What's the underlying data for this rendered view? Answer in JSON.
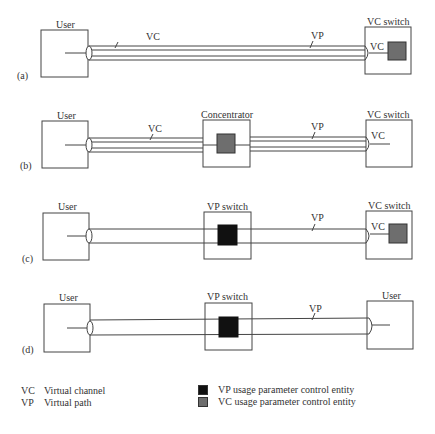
{
  "diagram": {
    "colors": {
      "vp_upc": "#111111",
      "vc_upc": "#6e6e6e",
      "line": "#444444"
    },
    "panels": [
      {
        "id": "a",
        "label": "(a)",
        "left_box": "User",
        "middle_box": null,
        "right_box": "VC switch",
        "pipe_label_1": "VC",
        "pipe_label_2": "VP",
        "inner_label": "VC"
      },
      {
        "id": "b",
        "label": "(b)",
        "left_box": "User",
        "middle_box": "Concentrator",
        "right_box": "VC switch",
        "pipe_label_1": "VC",
        "pipe_label_2": "VP",
        "inner_label": "VC"
      },
      {
        "id": "c",
        "label": "(c)",
        "left_box": "User",
        "middle_box": "VP switch",
        "right_box": "VC switch",
        "pipe_label_2": "VP",
        "inner_label": "VC"
      },
      {
        "id": "d",
        "label": "(d)",
        "left_box": "User",
        "middle_box": "VP switch",
        "right_box": "User",
        "pipe_label_2": "VP"
      }
    ],
    "legend": {
      "abbreviations": [
        {
          "abbr": "VC",
          "text": "Virtual channel"
        },
        {
          "abbr": "VP",
          "text": "Virtual path"
        }
      ],
      "entities": [
        {
          "text": "VP usage parameter control entity",
          "color": "#111111"
        },
        {
          "text": "VC usage parameter control entity",
          "color": "#6e6e6e"
        }
      ]
    }
  }
}
